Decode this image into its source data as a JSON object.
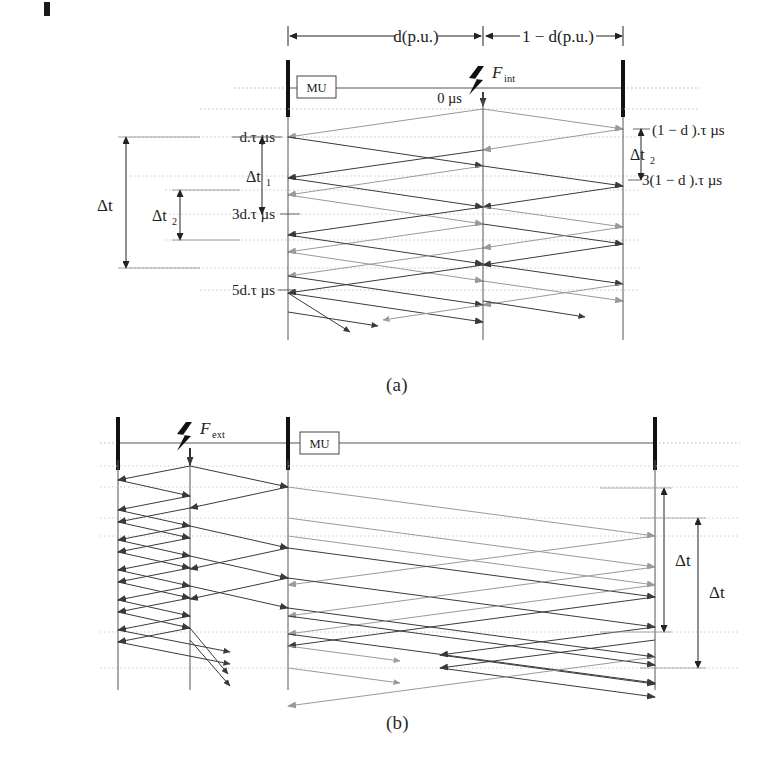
{
  "figure": {
    "type": "bewley-lattice-diagram",
    "captions": [
      {
        "id": "a",
        "text": "(a)"
      },
      {
        "id": "b",
        "text": "(b)"
      }
    ]
  },
  "panel_a": {
    "name": "internal-fault-lattice",
    "top_dimensions": [
      {
        "label": "d(p.u.)",
        "from": "left-busbar",
        "to": "fault-point"
      },
      {
        "label": "1 − d(p.u.)",
        "from": "fault-point",
        "to": "right-busbar"
      }
    ],
    "device_box": "MU",
    "fault_label": "F",
    "fault_sub": "int",
    "time_origin": "0 µs",
    "left_labels": [
      {
        "text": "d.τ µs"
      },
      {
        "text": "3d.τ µs"
      },
      {
        "text": "5d.τ µs"
      }
    ],
    "right_labels": [
      {
        "text": "(1 − d ).τ µs"
      },
      {
        "text": "3(1 − d ).τ µs"
      }
    ],
    "brackets": [
      {
        "text": "Δt",
        "sub": "",
        "side": "left-outer"
      },
      {
        "text": "Δt",
        "sub": "2",
        "side": "left-inner"
      },
      {
        "text": "Δt",
        "sub": "1",
        "side": "mid"
      },
      {
        "text": "Δt",
        "sub": "2",
        "side": "right"
      }
    ]
  },
  "panel_b": {
    "name": "external-fault-lattice",
    "device_box": "MU",
    "fault_label": "F",
    "fault_sub": "ext",
    "brackets": [
      {
        "text": "Δt",
        "side": "right-upper"
      },
      {
        "text": "Δt",
        "side": "right-lower"
      }
    ]
  },
  "colors": {
    "ink": "#222222",
    "line_dark": "#3a3a3a",
    "line_light": "#9a9a9a",
    "busbar": "#111111",
    "dotted": "#b4b4b4"
  }
}
